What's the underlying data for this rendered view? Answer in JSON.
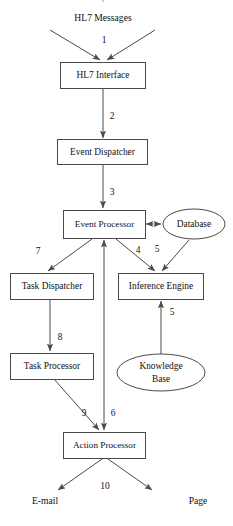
{
  "diagram": {
    "title_clipped": "",
    "nodes": [
      {
        "id": "hl7-messages",
        "label": "HL7 Messages",
        "shape": "text",
        "x": 103,
        "y": 18,
        "w": 80,
        "h": 14
      },
      {
        "id": "hl7-interface",
        "label": "HL7 Interface",
        "shape": "rect",
        "x": 60,
        "y": 62,
        "w": 85,
        "h": 26
      },
      {
        "id": "event-dispatcher",
        "label": "Event Dispatcher",
        "shape": "rect",
        "x": 57,
        "y": 139,
        "w": 90,
        "h": 25
      },
      {
        "id": "event-processor",
        "label": "Event Processor",
        "shape": "rect",
        "x": 63,
        "y": 210,
        "w": 80,
        "h": 28
      },
      {
        "id": "database",
        "label": "Database",
        "shape": "ellipse",
        "x": 163,
        "y": 209,
        "w": 62,
        "h": 30
      },
      {
        "id": "task-dispatcher",
        "label": "Task Dispatcher",
        "shape": "rect",
        "x": 10,
        "y": 273,
        "w": 83,
        "h": 26
      },
      {
        "id": "inference-engine",
        "label": "Inference Engine",
        "shape": "rect",
        "x": 118,
        "y": 273,
        "w": 85,
        "h": 26
      },
      {
        "id": "task-processor",
        "label": "Task Processor",
        "shape": "rect",
        "x": 10,
        "y": 353,
        "w": 83,
        "h": 26
      },
      {
        "id": "knowledge-base",
        "label": "Knowledge Base",
        "label_line1": "Knowledge",
        "label_line2": "Base",
        "shape": "ellipse",
        "x": 117,
        "y": 354,
        "w": 88,
        "h": 37
      },
      {
        "id": "action-processor",
        "label": "Action Processor",
        "shape": "rect",
        "x": 63,
        "y": 432,
        "w": 82,
        "h": 26
      },
      {
        "id": "email",
        "label": "E-mail",
        "shape": "text",
        "x": 45,
        "y": 501,
        "w": 40,
        "h": 14
      },
      {
        "id": "page",
        "label": "Page",
        "shape": "text",
        "x": 198,
        "y": 501,
        "w": 34,
        "h": 14
      }
    ],
    "edges": [
      {
        "id": "edge-1-left",
        "label": "",
        "from": "hl7-messages",
        "to": "hl7-interface"
      },
      {
        "id": "edge-1-right",
        "label": "",
        "from": "hl7-messages",
        "to": "hl7-interface"
      },
      {
        "id": "edge-1",
        "label": "1",
        "from": "hl7-messages",
        "to": "hl7-interface",
        "lx": 104,
        "ly": 41
      },
      {
        "id": "edge-2",
        "label": "2",
        "from": "hl7-interface",
        "to": "event-dispatcher",
        "lx": 112,
        "ly": 117
      },
      {
        "id": "edge-3",
        "label": "3",
        "from": "event-dispatcher",
        "to": "event-processor",
        "lx": 112,
        "ly": 193
      },
      {
        "id": "edge-db",
        "label": "",
        "from": "event-processor",
        "to": "database"
      },
      {
        "id": "edge-7",
        "label": "7",
        "from": "event-processor",
        "to": "task-dispatcher",
        "lx": 38,
        "ly": 252
      },
      {
        "id": "edge-4",
        "label": "4",
        "from": "event-processor",
        "to": "inference-engine",
        "lx": 138,
        "ly": 251
      },
      {
        "id": "edge-5-db",
        "label": "5",
        "from": "database",
        "to": "inference-engine",
        "lx": 157,
        "ly": 250
      },
      {
        "id": "edge-5-kb",
        "label": "5",
        "from": "knowledge-base",
        "to": "inference-engine",
        "lx": 172,
        "ly": 313
      },
      {
        "id": "edge-ie-ep",
        "label": "",
        "from": "inference-engine",
        "to": "event-processor"
      },
      {
        "id": "edge-8",
        "label": "8",
        "from": "task-dispatcher",
        "to": "task-processor",
        "lx": 60,
        "ly": 338
      },
      {
        "id": "edge-9",
        "label": "9",
        "from": "task-processor",
        "to": "action-processor",
        "lx": 84,
        "ly": 414
      },
      {
        "id": "edge-6",
        "label": "6",
        "from": "event-processor",
        "to": "action-processor",
        "lx": 113,
        "ly": 414
      },
      {
        "id": "edge-10",
        "label": "10",
        "from": "action-processor",
        "to": "email",
        "lx": 105,
        "ly": 487
      },
      {
        "id": "edge-10-page",
        "label": "",
        "from": "action-processor",
        "to": "page"
      }
    ],
    "colors": {
      "stroke": "#4a4a4a",
      "text": "#111111",
      "background": "#ffffff"
    }
  }
}
